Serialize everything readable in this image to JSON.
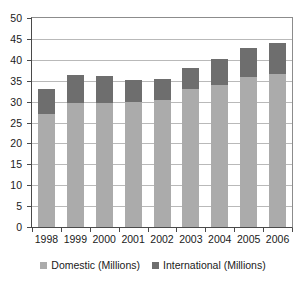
{
  "chart_data": {
    "type": "bar",
    "stacked": true,
    "title": "",
    "subtitle": "",
    "xlabel": "",
    "ylabel": "",
    "categories": [
      "1998",
      "1999",
      "2000",
      "2001",
      "2002",
      "2003",
      "2004",
      "2005",
      "2006"
    ],
    "series": [
      {
        "name": "Domestic (Millions)",
        "color": "#ababab",
        "values": [
          27.0,
          29.7,
          29.6,
          29.8,
          30.4,
          33.1,
          34.0,
          36.0,
          36.7
        ]
      },
      {
        "name": "International (Millions)",
        "color": "#6e6e6e",
        "values": [
          6.0,
          6.6,
          6.6,
          5.4,
          4.9,
          4.9,
          6.3,
          6.9,
          7.4
        ]
      }
    ],
    "totals": [
      33.0,
      36.3,
      36.2,
      35.2,
      35.3,
      38.0,
      40.3,
      42.9,
      44.1
    ],
    "ylim": [
      0,
      50
    ],
    "ytick_values": [
      0,
      5,
      10,
      15,
      20,
      25,
      30,
      35,
      40,
      45,
      50
    ],
    "ytick_labels": [
      "0",
      "5",
      "10",
      "15",
      "20",
      "25",
      "30",
      "35",
      "40",
      "45",
      "50"
    ],
    "grid": true,
    "grid_axis": "y",
    "legend_position": "bottom",
    "legend_entries": [
      {
        "label": "Domestic (Millions)",
        "color": "#ababab",
        "icon": "legend-swatch-icon"
      },
      {
        "label": "International (Millions)",
        "color": "#6e6e6e",
        "icon": "legend-swatch-icon"
      }
    ]
  },
  "colors": {
    "domestic": "#ababab",
    "international": "#6e6e6e",
    "gridline": "#b9b9b9",
    "axis": "#4a4a4a",
    "frame": "#8c8c8c",
    "background": "#ffffff",
    "text": "#1a1a1a"
  }
}
